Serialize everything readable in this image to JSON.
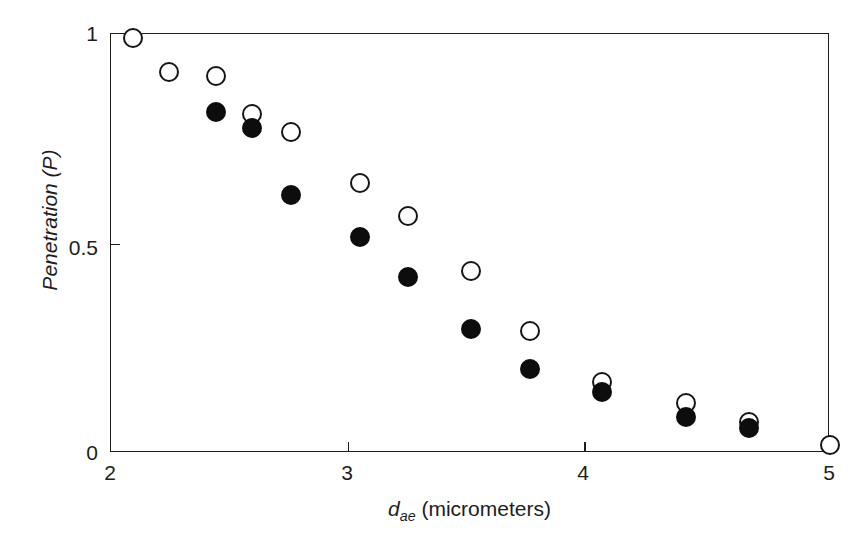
{
  "figure": {
    "background_color": "#ffffff",
    "frame_color": "#1d1d1d"
  },
  "axes": {
    "x": {
      "label_prefix": "d",
      "label_sub": "ae",
      "label_suffix": " (micrometers)",
      "label_full": "d_ae (micrometers)",
      "ticks": [
        "2",
        "3",
        "4",
        "5"
      ],
      "min": 2,
      "max": 5
    },
    "y": {
      "label_prefix": "Penetration (",
      "label_symbol": "P",
      "label_suffix": ")",
      "label_full": "Penetration (P)",
      "ticks": [
        "0",
        "0.5",
        "1"
      ],
      "min": 0,
      "max": 1
    }
  },
  "chart_data": {
    "type": "scatter",
    "title": "",
    "xlabel": "d_ae (micrometers)",
    "ylabel": "Penetration (P)",
    "xlim": [
      2,
      5
    ],
    "ylim": [
      0,
      1
    ],
    "xticks": [
      2,
      3,
      4,
      5
    ],
    "yticks": [
      0,
      0.5,
      1
    ],
    "grid": false,
    "legend": "none",
    "marker_colors": {
      "open": "#ffffff",
      "open_edge": "#151515",
      "filled": "#0d0d0d"
    },
    "series": [
      {
        "name": "open-circles",
        "marker": "open-circle",
        "points": [
          {
            "x": 2.09,
            "y": 0.99
          },
          {
            "x": 2.24,
            "y": 0.91
          },
          {
            "x": 2.44,
            "y": 0.9
          },
          {
            "x": 2.59,
            "y": 0.81
          },
          {
            "x": 2.75,
            "y": 0.765
          },
          {
            "x": 3.04,
            "y": 0.645
          },
          {
            "x": 3.24,
            "y": 0.565
          },
          {
            "x": 3.5,
            "y": 0.435
          },
          {
            "x": 3.75,
            "y": 0.29
          },
          {
            "x": 4.05,
            "y": 0.17
          },
          {
            "x": 4.4,
            "y": 0.12
          },
          {
            "x": 4.66,
            "y": 0.075
          },
          {
            "x": 5.0,
            "y": 0.02
          }
        ]
      },
      {
        "name": "filled-circles",
        "marker": "filled-circle",
        "points": [
          {
            "x": 2.44,
            "y": 0.815
          },
          {
            "x": 2.59,
            "y": 0.775
          },
          {
            "x": 2.75,
            "y": 0.615
          },
          {
            "x": 3.04,
            "y": 0.515
          },
          {
            "x": 3.24,
            "y": 0.42
          },
          {
            "x": 3.5,
            "y": 0.295
          },
          {
            "x": 3.75,
            "y": 0.2
          },
          {
            "x": 4.05,
            "y": 0.145
          },
          {
            "x": 4.4,
            "y": 0.085
          },
          {
            "x": 4.66,
            "y": 0.06
          }
        ]
      }
    ]
  }
}
